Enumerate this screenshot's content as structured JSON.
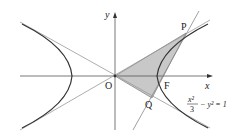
{
  "diagram": {
    "equation": {
      "numerator": "x²",
      "denominator": "3",
      "rest": "− y² = 1"
    },
    "labels": {
      "x_axis": "x",
      "y_axis": "y",
      "origin": "O",
      "focus": "F",
      "point_p": "P",
      "point_q": "Q"
    },
    "colors": {
      "curve": "#333333",
      "asymptote": "#888888",
      "axis": "#555555",
      "shade": "#c8c8c8"
    }
  }
}
